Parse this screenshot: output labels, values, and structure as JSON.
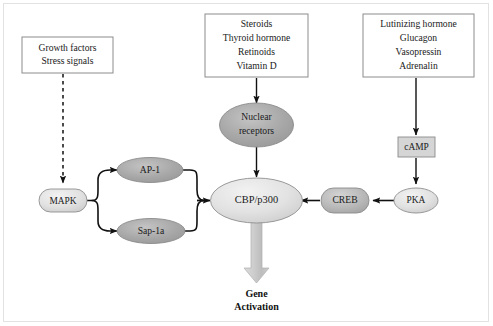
{
  "diagram": {
    "background_color": "#ffffff",
    "frame_color": "#e2e2e2",
    "stimulus_boxes": [
      {
        "id": "growth-factors",
        "lines": [
          "Growth factors",
          "Stress signals"
        ]
      },
      {
        "id": "steroids",
        "lines": [
          "Steroids",
          "Thyroid hormone",
          "Retinoids",
          "Vitamin D"
        ]
      },
      {
        "id": "hormones",
        "lines": [
          "Lutinizing hormone",
          "Glucagon",
          "Vasopressin",
          "Adrenalin"
        ]
      }
    ],
    "nodes": [
      {
        "id": "mapk",
        "label": "MAPK",
        "shape": "rounded-rect",
        "fill": "#d8d8d8"
      },
      {
        "id": "ap1",
        "label": "AP-1",
        "shape": "ellipse",
        "fill": "#a9a9a9"
      },
      {
        "id": "sap1a",
        "label": "Sap-1a",
        "shape": "ellipse",
        "fill": "#a9a9a9"
      },
      {
        "id": "nuclear",
        "label": "Nuclear receptors",
        "shape": "ellipse",
        "fill": "#a9a9a9"
      },
      {
        "id": "cbp",
        "label": "CBP/p300",
        "shape": "ellipse",
        "fill": "#e0e0e0"
      },
      {
        "id": "creb",
        "label": "CREB",
        "shape": "rounded-rect",
        "fill": "#b5b5b5"
      },
      {
        "id": "camp",
        "label": "cAMP",
        "shape": "rect",
        "fill": "#d5d5d5"
      },
      {
        "id": "pka",
        "label": "PKA",
        "shape": "ellipse",
        "fill": "#dcdcdc"
      }
    ],
    "node_labels": {
      "mapk": "MAPK",
      "ap1": "AP-1",
      "sap1a": "Sap-1a",
      "nuclear_line1": "Nuclear",
      "nuclear_line2": "receptors",
      "cbp": "CBP/p300",
      "creb": "CREB",
      "camp": "cAMP",
      "pka": "PKA"
    },
    "outcome": {
      "line1": "Gene",
      "line2": "Activation",
      "arrow_color": "#bfbfbf"
    },
    "edges": [
      {
        "from": "growth-factors",
        "to": "mapk",
        "style": "dashed"
      },
      {
        "from": "mapk",
        "to": "ap1",
        "style": "solid-curved"
      },
      {
        "from": "mapk",
        "to": "sap1a",
        "style": "solid-curved"
      },
      {
        "from": "ap1",
        "to": "cbp",
        "style": "solid-curved"
      },
      {
        "from": "sap1a",
        "to": "cbp",
        "style": "solid-curved"
      },
      {
        "from": "steroids",
        "to": "nuclear",
        "style": "solid"
      },
      {
        "from": "nuclear",
        "to": "cbp",
        "style": "solid"
      },
      {
        "from": "hormones",
        "to": "camp",
        "style": "solid"
      },
      {
        "from": "camp",
        "to": "pka",
        "style": "solid"
      },
      {
        "from": "pka",
        "to": "creb",
        "style": "solid"
      },
      {
        "from": "creb",
        "to": "cbp",
        "style": "solid"
      },
      {
        "from": "cbp",
        "to": "gene-activation",
        "style": "block-arrow"
      }
    ]
  }
}
